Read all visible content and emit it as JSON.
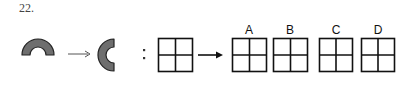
{
  "question": {
    "number": "22."
  },
  "example": {
    "source_shape": "semicircular-arch-opening-down",
    "target_shape": "semicircular-arch-opening-right",
    "arrow": "thin-right-arrow",
    "shape_fill": "#6e6e6e",
    "shape_stroke": "#222222"
  },
  "analogy_separator": ":",
  "query": {
    "grid": "2x2-grid",
    "arrow": "bold-right-arrow"
  },
  "options": [
    {
      "label": "A",
      "grid": "2x2-grid"
    },
    {
      "label": "B",
      "grid": "2x2-grid"
    },
    {
      "label": "C",
      "grid": "2x2-grid"
    },
    {
      "label": "D",
      "grid": "2x2-grid"
    }
  ],
  "colors": {
    "line": "#111111",
    "background": "#ffffff"
  }
}
